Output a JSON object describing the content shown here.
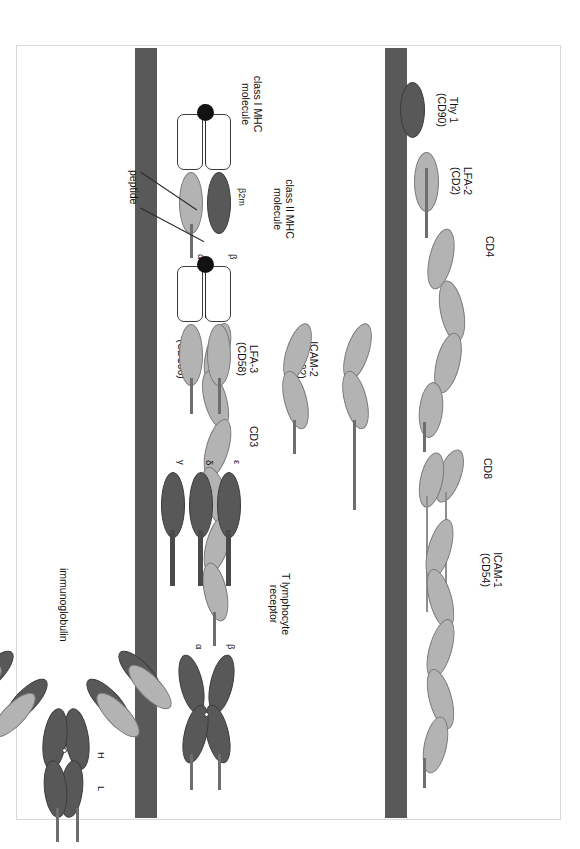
{
  "figure": {
    "orientation": "rotated-90-clockwise",
    "colors": {
      "membrane": "#595959",
      "light_domain": "#b3b3b3",
      "dark_domain": "#585858",
      "stalk": "#6e6e6e",
      "peptide": "#121212",
      "mhc_box_fill": "#ffffff",
      "mhc_box_stroke": "#3b3b3b",
      "frame_border": "#d8d8d8"
    }
  },
  "membranes": {
    "upper_label": "upper-cell-membrane",
    "lower_label": "lower-cell-membrane"
  },
  "top_row": {
    "molecules": [
      {
        "id": "thy1",
        "name": "Thy 1",
        "cd": "(CD90)",
        "domains": 1,
        "shade": "dark",
        "note": "GPI-anchored single Ig domain"
      },
      {
        "id": "lfa2",
        "name": "LFA-2",
        "cd": "(CD2)",
        "domains": 1,
        "shade": "light"
      },
      {
        "id": "cd4",
        "name": "CD4",
        "cd": "",
        "domains": 4,
        "shade": "light"
      },
      {
        "id": "cd8",
        "name": "CD8",
        "cd": "",
        "domains": 2,
        "shade": "light",
        "note": "two chains with long stalks"
      },
      {
        "id": "icam1",
        "name": "ICAM-1",
        "cd": "(CD54)",
        "domains": 5,
        "shade": "light"
      },
      {
        "id": "icam2",
        "name": "ICAM-2",
        "cd": "(CD102)",
        "domains": 2,
        "shade": "light"
      },
      {
        "id": "lfa3",
        "name": "LFA-3",
        "cd": "(CD58)",
        "domains": 2,
        "shade": "light"
      },
      {
        "id": "vcam1",
        "name": "VCAM-1",
        "cd": "(CD106)",
        "domains": 6,
        "shade": "light"
      }
    ]
  },
  "bottom_row": {
    "molecules": [
      {
        "id": "mhc1",
        "name": "class I MHC",
        "name_line2": "molecule",
        "chains": [
          "α"
        ],
        "extra_label": "β2m",
        "peptide_label": "peptide"
      },
      {
        "id": "mhc2",
        "name": "class II MHC",
        "name_line2": "molecule",
        "chains": [
          "α",
          "β"
        ],
        "peptide_label": "peptide"
      },
      {
        "id": "cd3",
        "name": "CD3",
        "chains": [
          "γ",
          "δ",
          "ε"
        ]
      },
      {
        "id": "tcr",
        "name": "T lymphocyte",
        "name_line2": "receptor",
        "chains": [
          "α",
          "β"
        ]
      },
      {
        "id": "ig",
        "name": "immunoglobulin",
        "chains": [
          "H",
          "L"
        ]
      }
    ]
  },
  "chain_labels": {
    "alpha": "α",
    "beta": "β",
    "gamma": "γ",
    "delta": "δ",
    "epsilon": "ε",
    "heavy": "H",
    "light": "L",
    "b2m": "β2m",
    "peptide": "peptide"
  }
}
